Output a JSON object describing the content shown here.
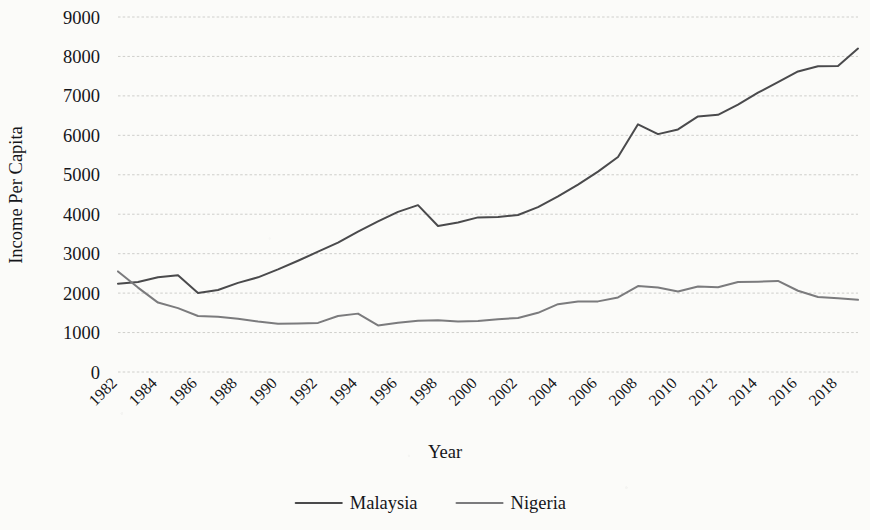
{
  "chart_data": {
    "type": "line",
    "title": "",
    "xlabel": "Year",
    "ylabel": "Income Per Capita",
    "ylim": [
      0,
      9000
    ],
    "ytick_step": 1000,
    "yticks": [
      "0",
      "1000",
      "2000",
      "3000",
      "4000",
      "5000",
      "6000",
      "7000",
      "8000",
      "9000"
    ],
    "xlim": [
      1982,
      2019
    ],
    "xtick_step": 2,
    "xticks": [
      "1982",
      "1984",
      "1986",
      "1988",
      "1990",
      "1992",
      "1994",
      "1996",
      "1998",
      "2000",
      "2002",
      "2004",
      "2006",
      "2008",
      "2010",
      "2012",
      "2014",
      "2016",
      "2018"
    ],
    "xtick_rotation_deg": 45,
    "grid": "horizontal-dashed",
    "legend_position": "bottom-center",
    "x": [
      1982,
      1983,
      1984,
      1985,
      1986,
      1987,
      1988,
      1989,
      1990,
      1991,
      1992,
      1993,
      1994,
      1995,
      1996,
      1997,
      1998,
      1999,
      2000,
      2001,
      2002,
      2003,
      2004,
      2005,
      2006,
      2007,
      2008,
      2009,
      2010,
      2011,
      2012,
      2013,
      2014,
      2015,
      2016,
      2017,
      2018,
      2019
    ],
    "series": [
      {
        "name": "Malaysia",
        "color": "#4a4a4c",
        "values": [
          2240,
          2280,
          2400,
          2450,
          2000,
          2080,
          2260,
          2400,
          2600,
          2820,
          3050,
          3280,
          3560,
          3820,
          4060,
          4230,
          3700,
          3790,
          3920,
          3930,
          3980,
          4180,
          4450,
          4750,
          5080,
          5450,
          6280,
          6030,
          6150,
          6480,
          6520,
          6780,
          7080,
          7350,
          7620,
          7750,
          7760,
          8200
        ]
      },
      {
        "name": "Nigeria",
        "color": "#7b7b7d",
        "values": [
          2550,
          2140,
          1760,
          1620,
          1420,
          1400,
          1350,
          1280,
          1225,
          1230,
          1245,
          1420,
          1480,
          1180,
          1250,
          1300,
          1310,
          1280,
          1290,
          1340,
          1370,
          1500,
          1720,
          1790,
          1790,
          1890,
          2180,
          2140,
          2040,
          2170,
          2150,
          2280,
          2290,
          2310,
          2060,
          1900,
          1870,
          1830
        ]
      }
    ],
    "legend": [
      {
        "label": "Malaysia",
        "color": "#4a4a4c"
      },
      {
        "label": "Nigeria",
        "color": "#7b7b7d"
      }
    ]
  }
}
